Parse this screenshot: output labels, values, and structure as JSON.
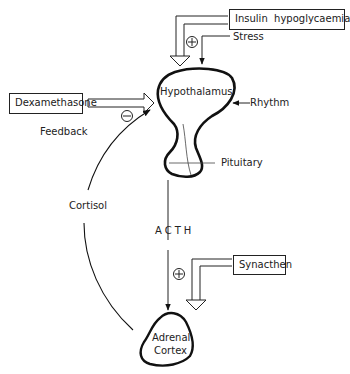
{
  "diagram": {
    "title": "",
    "nodes": {
      "insulin": {
        "label": "Insulin  hypoglycaemia"
      },
      "stress": {
        "label": "Stress"
      },
      "dexamethasone": {
        "label": "Dexamethasone"
      },
      "feedback": {
        "label": "Feedback"
      },
      "hypothalamus": {
        "label": "Hypothalamus"
      },
      "rhythm": {
        "label": "Rhythm"
      },
      "pituitary": {
        "label": "Pituitary"
      },
      "cortisol": {
        "label": "Cortisol"
      },
      "acth": {
        "label": "ACTH"
      },
      "synacthen": {
        "label": "Synacthen"
      },
      "adrenal": {
        "line1": "Adrenal",
        "line2": "Cortex"
      }
    },
    "signs": {
      "stress_sign": "+",
      "feedback_sign": "−",
      "synacthen_sign": "+"
    },
    "edges": [
      {
        "from": "Insulin hypoglycaemia",
        "to": "Hypothalamus",
        "style": "hollow-arrow"
      },
      {
        "from": "Stress",
        "to": "Hypothalamus",
        "style": "arrow",
        "sign": "+"
      },
      {
        "from": "Dexamethasone",
        "to": "Hypothalamus",
        "style": "hollow-arrow"
      },
      {
        "from": "Rhythm",
        "to": "Hypothalamus",
        "style": "arrow"
      },
      {
        "from": "Pituitary",
        "to": "Adrenal Cortex",
        "label": "ACTH",
        "style": "arrow"
      },
      {
        "from": "Synacthen",
        "to": "Adrenal Cortex",
        "style": "hollow-arrow",
        "sign": "+"
      },
      {
        "from": "Adrenal Cortex",
        "to": "Hypothalamus",
        "label": "Cortisol",
        "style": "curved-arrow",
        "sign": "−"
      }
    ]
  }
}
